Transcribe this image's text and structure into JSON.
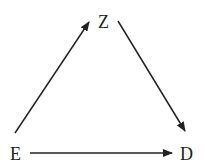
{
  "nodes": {
    "z": {
      "label": "Z"
    },
    "e": {
      "label": "E"
    },
    "d": {
      "label": "D"
    }
  },
  "edges": [
    {
      "from": "E",
      "to": "Z"
    },
    {
      "from": "Z",
      "to": "D"
    },
    {
      "from": "E",
      "to": "D"
    }
  ],
  "colors": {
    "stroke": "#222222",
    "background": "#ffffff"
  }
}
